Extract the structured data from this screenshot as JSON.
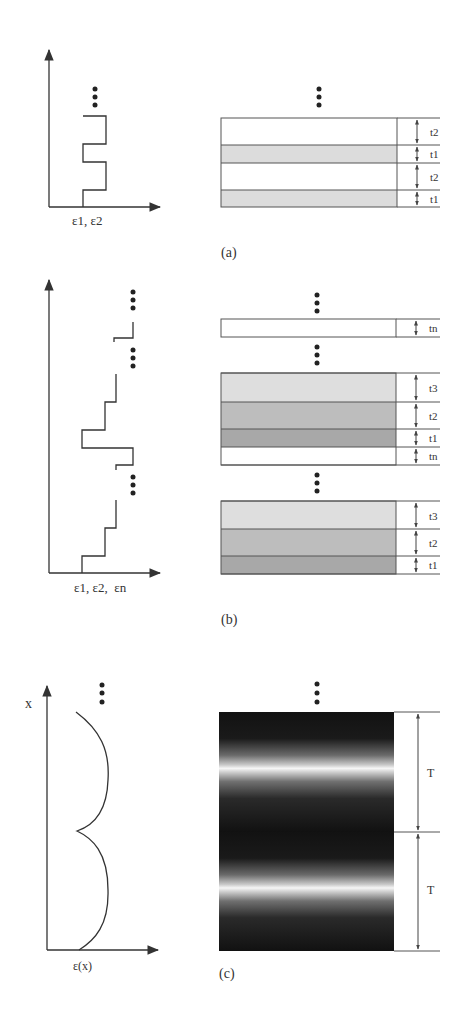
{
  "figure": {
    "panels": [
      {
        "id": "a",
        "caption": "(a)",
        "plot": {
          "x_axis_label": "ε1, ε2",
          "description": "Periodic two-level step profile of permittivity"
        },
        "stack": {
          "layers": [
            {
              "label": "t2",
              "fill": "#ffffff"
            },
            {
              "label": "t1",
              "fill": "#dcdcdc"
            },
            {
              "label": "t2",
              "fill": "#ffffff"
            },
            {
              "label": "t1",
              "fill": "#dcdcdc"
            }
          ]
        }
      },
      {
        "id": "b",
        "caption": "(b)",
        "plot": {
          "x_axis_label": "ε1, ε2,  εn",
          "description": "Periodic multi-level step profile of permittivity"
        },
        "stack": {
          "top_layer": {
            "label": "tn",
            "fill": "#ffffff"
          },
          "block_1": [
            {
              "label": "t3",
              "fill": "#dedede"
            },
            {
              "label": "t2",
              "fill": "#bdbdbd"
            },
            {
              "label": "t1",
              "fill": "#a8a8a8"
            },
            {
              "label": "tn",
              "fill": "#ffffff"
            }
          ],
          "block_2": [
            {
              "label": "t3",
              "fill": "#dedede"
            },
            {
              "label": "t2",
              "fill": "#bdbdbd"
            },
            {
              "label": "t1",
              "fill": "#a8a8a8"
            }
          ]
        }
      },
      {
        "id": "c",
        "caption": "(c)",
        "plot": {
          "y_axis_label": "x",
          "x_axis_label": "ε(x)",
          "description": "Continuous periodic permittivity profile"
        },
        "stack": {
          "periods": [
            {
              "label": "T"
            },
            {
              "label": "T"
            }
          ],
          "colors": {
            "dark": "#151515",
            "bright": "#f4f4f4"
          }
        }
      }
    ],
    "ellipsis_symbol": "⋮"
  }
}
